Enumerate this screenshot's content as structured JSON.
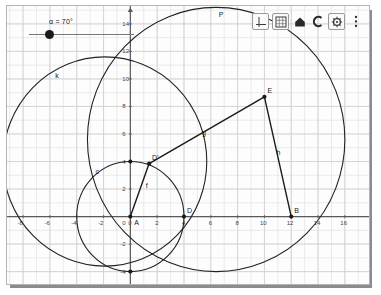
{
  "app": {
    "title": "Geometry Applet",
    "background": "#ffffff",
    "panel_bg": "#fdfdfd",
    "panel_border": "#b4b4b4",
    "shadow_color": "#8c8c8c"
  },
  "slider": {
    "name": "alpha-slider",
    "label": "α = 70°",
    "variable": "α",
    "value": "70",
    "unit": "°",
    "min": 0,
    "max": 360,
    "knob_fraction": 0.19
  },
  "toolbar": {
    "buttons": [
      {
        "name": "axes-toggle-button",
        "icon": "axes-icon",
        "label": "Axes"
      },
      {
        "name": "grid-toggle-button",
        "icon": "grid-icon",
        "label": "Grid"
      },
      {
        "name": "home-button",
        "icon": "home-icon",
        "label": "Standard View"
      },
      {
        "name": "undo-button",
        "icon": "undo-icon",
        "label": "Undo"
      },
      {
        "name": "settings-button",
        "icon": "gear-icon",
        "label": "Settings"
      },
      {
        "name": "more-menu-button",
        "icon": "kebab-menu-icon",
        "label": "More"
      }
    ]
  },
  "chart_data": {
    "type": "scatter",
    "title": "",
    "xlabel": "",
    "ylabel": "",
    "xlim": [
      -9.2,
      17.8
    ],
    "ylim": [
      -4.9,
      15.3
    ],
    "grid": true,
    "grid_step": 1,
    "major_step": 2,
    "axis_color": "#5a5a5a",
    "grid_color": "#e2e2e2",
    "major_grid_color": "#cfcfcf",
    "xticks": [
      -8,
      -6,
      -4,
      -2,
      0,
      2,
      4,
      6,
      8,
      10,
      12,
      14,
      16
    ],
    "yticks": [
      14,
      12,
      10,
      8,
      6,
      4,
      2,
      0,
      -2,
      -4
    ],
    "points": [
      {
        "name": "A",
        "label": "A",
        "x": 0,
        "y": 0,
        "label_dx": 4,
        "label_dy": 8,
        "filled": true
      },
      {
        "name": "D",
        "label": "D",
        "x": 4,
        "y": 0,
        "label_dx": 3,
        "label_dy": -4,
        "filled": true
      },
      {
        "name": "B",
        "label": "B",
        "x": 12,
        "y": 0,
        "label_dx": 3,
        "label_dy": -4,
        "filled": true
      },
      {
        "name": "E",
        "label": "E",
        "x": 10,
        "y": 8.7,
        "label_dx": 3,
        "label_dy": -4,
        "filled": true
      },
      {
        "name": "Dp",
        "label": "D'",
        "x": 1.4,
        "y": 3.85,
        "label_dx": 3,
        "label_dy": -4,
        "filled": true
      },
      {
        "name": "Ctop",
        "label": "",
        "x": 0,
        "y": 4,
        "label_dx": 0,
        "label_dy": 0,
        "filled": true
      },
      {
        "name": "Cbot",
        "label": "",
        "x": 0,
        "y": -4,
        "label_dx": 0,
        "label_dy": 0,
        "filled": true
      }
    ],
    "circles": [
      {
        "name": "c",
        "label": "c",
        "cx": 0,
        "cy": 0,
        "r": 4,
        "label_x": -2.6,
        "label_y": 3.1
      },
      {
        "name": "k",
        "label": "k",
        "cx": -1.9,
        "cy": 4.0,
        "r": 7.6,
        "label_x": -5.6,
        "label_y": 10.1
      },
      {
        "name": "P",
        "label": "P",
        "cx": 6.4,
        "cy": 5.6,
        "r": 9.6,
        "label_x": 6.6,
        "label_y": 14.5
      }
    ],
    "segments": [
      {
        "name": "f",
        "label": "f",
        "x1": 0,
        "y1": 0,
        "x2": 1.4,
        "y2": 3.85,
        "label_x": 1.15,
        "label_y": 2.05
      },
      {
        "name": "g",
        "label": "g",
        "x1": 1.4,
        "y1": 3.85,
        "x2": 10,
        "y2": 8.7,
        "label_x": 5.35,
        "label_y": 5.9
      },
      {
        "name": "h",
        "label": "h",
        "x1": 10,
        "y1": 8.7,
        "x2": 12,
        "y2": 0,
        "label_x": 10.9,
        "label_y": 4.5
      }
    ]
  }
}
